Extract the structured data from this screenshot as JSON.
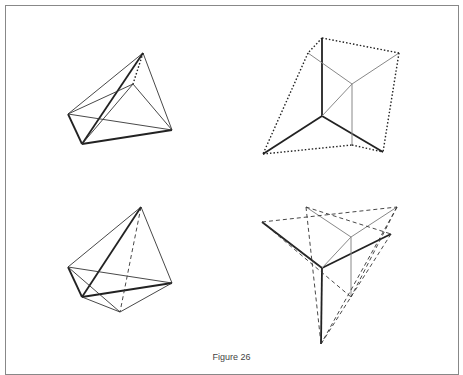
{
  "caption": "Figure 26",
  "figures": [
    {
      "name": "figure-top-left",
      "points": {
        "T": [
          143,
          53
        ],
        "L": [
          68,
          114
        ],
        "B": [
          82,
          144
        ],
        "R": [
          172,
          130
        ],
        "I": [
          133,
          84
        ]
      },
      "edges": [
        {
          "a": "T",
          "b": "L",
          "style": "thin"
        },
        {
          "a": "T",
          "b": "R",
          "style": "thin"
        },
        {
          "a": "T",
          "b": "B",
          "style": "bold"
        },
        {
          "a": "L",
          "b": "B",
          "style": "bold"
        },
        {
          "a": "B",
          "b": "R",
          "style": "bold"
        },
        {
          "a": "L",
          "b": "R",
          "style": "thin"
        },
        {
          "a": "L",
          "b": "I",
          "style": "thin"
        },
        {
          "a": "I",
          "b": "R",
          "style": "thin"
        },
        {
          "a": "I",
          "b": "B",
          "style": "thin"
        },
        {
          "a": "T",
          "b": "I",
          "style": "dotted"
        }
      ]
    },
    {
      "name": "figure-top-right",
      "points": {
        "T": [
          322,
          38
        ],
        "U": [
          308,
          53
        ],
        "R": [
          399,
          53
        ],
        "I": [
          352,
          84
        ],
        "C": [
          322,
          116
        ],
        "BL": [
          263,
          154
        ],
        "BM": [
          352,
          145
        ],
        "BR": [
          383,
          152
        ]
      },
      "edges": [
        {
          "a": "T",
          "b": "C",
          "style": "bold"
        },
        {
          "a": "C",
          "b": "BL",
          "style": "bold"
        },
        {
          "a": "C",
          "b": "BR",
          "style": "bold"
        },
        {
          "a": "U",
          "b": "I",
          "style": "gray"
        },
        {
          "a": "R",
          "b": "I",
          "style": "gray"
        },
        {
          "a": "I",
          "b": "BM",
          "style": "gray"
        },
        {
          "a": "C",
          "b": "I",
          "style": "gray"
        },
        {
          "a": "T",
          "b": "U",
          "style": "dotted"
        },
        {
          "a": "T",
          "b": "R",
          "style": "dotted"
        },
        {
          "a": "U",
          "b": "BL",
          "style": "dotted"
        },
        {
          "a": "R",
          "b": "BR",
          "style": "dotted"
        },
        {
          "a": "BL",
          "b": "BM",
          "style": "dotted"
        },
        {
          "a": "BM",
          "b": "BR",
          "style": "dotted"
        }
      ]
    },
    {
      "name": "figure-bottom-left",
      "points": {
        "T": [
          141,
          207
        ],
        "L": [
          68,
          267
        ],
        "I": [
          82,
          297
        ],
        "R": [
          172,
          283
        ],
        "B": [
          120,
          312
        ]
      },
      "edges": [
        {
          "a": "T",
          "b": "L",
          "style": "thin"
        },
        {
          "a": "T",
          "b": "R",
          "style": "thin"
        },
        {
          "a": "T",
          "b": "I",
          "style": "bold"
        },
        {
          "a": "L",
          "b": "I",
          "style": "bold"
        },
        {
          "a": "I",
          "b": "R",
          "style": "bold"
        },
        {
          "a": "L",
          "b": "R",
          "style": "thin"
        },
        {
          "a": "L",
          "b": "B",
          "style": "thin"
        },
        {
          "a": "I",
          "b": "B",
          "style": "thin"
        },
        {
          "a": "R",
          "b": "B",
          "style": "thin"
        },
        {
          "a": "T",
          "b": "B",
          "style": "dashed"
        }
      ]
    },
    {
      "name": "figure-bottom-right",
      "points": {
        "L": [
          262,
          222
        ],
        "TM": [
          306,
          207
        ],
        "TR": [
          397,
          207
        ],
        "RA": [
          391,
          234
        ],
        "C": [
          322,
          268
        ],
        "I": [
          351,
          237
        ],
        "B": [
          321,
          344
        ],
        "MB": [
          351,
          297
        ]
      },
      "edges": [
        {
          "a": "C",
          "b": "L",
          "style": "bold"
        },
        {
          "a": "C",
          "b": "RA",
          "style": "bold"
        },
        {
          "a": "C",
          "b": "B",
          "style": "bold"
        },
        {
          "a": "TM",
          "b": "I",
          "style": "gray"
        },
        {
          "a": "TR",
          "b": "I",
          "style": "gray"
        },
        {
          "a": "C",
          "b": "I",
          "style": "gray"
        },
        {
          "a": "I",
          "b": "MB",
          "style": "gray"
        },
        {
          "a": "L",
          "b": "TR",
          "style": "dashed"
        },
        {
          "a": "TM",
          "b": "RA",
          "style": "dashed"
        },
        {
          "a": "TM",
          "b": "B",
          "style": "dashed"
        },
        {
          "a": "L",
          "b": "MB",
          "style": "dashed"
        },
        {
          "a": "TR",
          "b": "MB",
          "style": "dashed"
        },
        {
          "a": "RA",
          "b": "B",
          "style": "dashed"
        },
        {
          "a": "TR",
          "b": "B",
          "style": "dashed"
        },
        {
          "a": "L",
          "b": "C",
          "style": "dashed"
        }
      ]
    }
  ]
}
